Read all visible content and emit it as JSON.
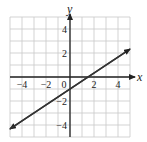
{
  "chart_data": {
    "type": "line",
    "title": "",
    "xlabel": "x",
    "ylabel": "y",
    "xlim": [
      -5,
      5
    ],
    "ylim": [
      -5,
      5
    ],
    "grid": true,
    "x_ticks": [
      -4,
      -2,
      0,
      2,
      4
    ],
    "x_tick_labels": [
      "−4",
      "−2",
      "0",
      "2",
      "4"
    ],
    "y_ticks": [
      4,
      2,
      -2,
      -4
    ],
    "y_tick_labels": [
      "4",
      "2",
      "−2",
      "−4"
    ],
    "series": [
      {
        "name": "line",
        "equation": "y = (2/3)x - 1",
        "x": [
          -5,
          5
        ],
        "y": [
          -4.33,
          2.33
        ],
        "arrows": "both"
      }
    ]
  },
  "colors": {
    "grid": "#c8c8c8",
    "axis": "#222222",
    "line": "#333333"
  }
}
